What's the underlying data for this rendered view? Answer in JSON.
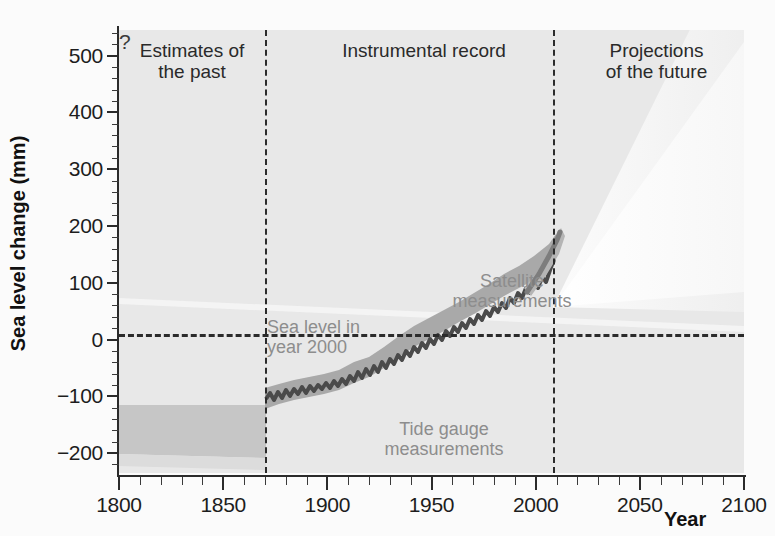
{
  "chart_data": {
    "type": "line",
    "title": "",
    "xlabel": "Year",
    "ylabel": "Sea level change (mm)",
    "xlim": [
      1800,
      2100
    ],
    "ylim": [
      -235,
      545
    ],
    "y_ticks": [
      500,
      400,
      300,
      200,
      100,
      0,
      -100,
      -200
    ],
    "y_tick_labels": [
      "500",
      "400",
      "300",
      "200",
      "100",
      "0",
      "−100",
      "−200"
    ],
    "y_minor_step": 20,
    "x_ticks": [
      1800,
      1850,
      1900,
      1950,
      2000,
      2050,
      2100
    ],
    "x_tick_labels": [
      "1800",
      "1850",
      "1900",
      "1950",
      "2000",
      "2050",
      "2100"
    ],
    "x_minor_step": 10,
    "grid": false,
    "legend_position": "none",
    "reference_lines": [
      {
        "name": "sea-level-year-2000",
        "orientation": "horizontal",
        "value": 0,
        "style": "dashed",
        "label": "Sea level in year 2000"
      },
      {
        "name": "start-instrumental-record",
        "orientation": "vertical",
        "value": 1870,
        "style": "dashed"
      },
      {
        "name": "start-projections",
        "orientation": "vertical",
        "value": 2007,
        "style": "dashed"
      }
    ],
    "regions": [
      {
        "name": "estimates-of-the-past",
        "x_range": [
          1800,
          1870
        ],
        "label": "Estimates of the past"
      },
      {
        "name": "instrumental-record",
        "x_range": [
          1870,
          2007
        ],
        "label": "Instrumental record"
      },
      {
        "name": "projections-of-the-future",
        "x_range": [
          2007,
          2100
        ],
        "label": "Projections of the future"
      }
    ],
    "series": [
      {
        "name": "Proxy estimate uncertainty band",
        "type": "band",
        "x": [
          1800,
          1870
        ],
        "y_lower": [
          -205,
          -205
        ],
        "y_upper": [
          -125,
          -125
        ]
      },
      {
        "name": "Tide gauge measurements",
        "type": "line",
        "label": "Tide gauge measurements",
        "x": [
          1870,
          1880,
          1890,
          1900,
          1910,
          1920,
          1930,
          1940,
          1950,
          1960,
          1970,
          1980,
          1990,
          2000,
          2005
        ],
        "y": [
          -158,
          -150,
          -142,
          -140,
          -131,
          -120,
          -112,
          -95,
          -75,
          -58,
          -45,
          -30,
          -12,
          10,
          35
        ],
        "y_lower": [
          -180,
          -172,
          -163,
          -158,
          -150,
          -138,
          -128,
          -112,
          -92,
          -74,
          -60,
          -44,
          -26,
          -5,
          20
        ],
        "y_upper": [
          -136,
          -128,
          -122,
          -120,
          -112,
          -102,
          -96,
          -78,
          -58,
          -42,
          -30,
          -16,
          2,
          25,
          50
        ]
      },
      {
        "name": "Satellite measurements",
        "type": "line",
        "label": "Satellite measurements",
        "x": [
          1993,
          2000,
          2005
        ],
        "y": [
          0,
          20,
          48
        ]
      },
      {
        "name": "Projection envelope (upper)",
        "type": "line",
        "x": [
          2007,
          2030,
          2060,
          2100
        ],
        "y": [
          55,
          200,
          420,
          780
        ]
      },
      {
        "name": "Projection envelope (mid)",
        "type": "line",
        "x": [
          2007,
          2030,
          2060,
          2100
        ],
        "y": [
          50,
          120,
          240,
          450
        ]
      },
      {
        "name": "Projection envelope (lower)",
        "type": "line",
        "x": [
          2007,
          2030,
          2060,
          2100
        ],
        "y": [
          45,
          65,
          90,
          130
        ]
      }
    ],
    "annotations": [
      {
        "name": "sea-level-2000-label",
        "text": "Sea level in year 2000",
        "x": 1875,
        "y": 20
      },
      {
        "name": "satellite-label",
        "text": "Satellite measurements",
        "x": 1972,
        "y": 110
      },
      {
        "name": "tide-gauge-label",
        "text": "Tide gauge measurements",
        "x": 1950,
        "y": -155
      },
      {
        "name": "uncertainty-question-mark",
        "text": "?",
        "x": 2053,
        "y": 185
      }
    ],
    "colors": {
      "plot_background": "#e8e8e8",
      "axis": "#2b2b2b",
      "data_line": "#4a4a4a",
      "data_band": "#a9a9a9",
      "past_band": "#c3c3c3",
      "projection_fan_outer": "#ededed",
      "projection_fan_inner": "#f5f5f5",
      "annotation_text": "#8d8d8d",
      "heading_text": "#2a2a2a"
    }
  },
  "headings": {
    "past": "Estimates of\nthe past",
    "past_line1": "Estimates of",
    "past_line2": "the past",
    "instrumental": "Instrumental record",
    "projections_line1": "Projections",
    "projections_line2": "of the future"
  },
  "annotations": {
    "sea_level_line1": "Sea level in",
    "sea_level_line2": "year 2000",
    "satellite_line1": "Satellite",
    "satellite_line2": "measurements",
    "tide_line1": "Tide gauge",
    "tide_line2": "measurements",
    "question": "?"
  },
  "axes": {
    "y_title": "Sea level change (mm)",
    "x_title": "Year",
    "y_labels": [
      "500",
      "400",
      "300",
      "200",
      "100",
      "0",
      "−100",
      "−200"
    ],
    "x_labels": [
      "1800",
      "1850",
      "1900",
      "1950",
      "2000",
      "2050",
      "2100"
    ]
  }
}
